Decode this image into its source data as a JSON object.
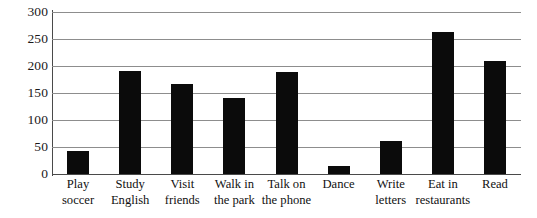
{
  "chart_data": {
    "type": "bar",
    "title": "",
    "subtitle": "",
    "xlabel": "",
    "ylabel": "",
    "categories": [
      "Play\nsoccer",
      "Study\nEnglish",
      "Visit\nfriends",
      "Walk in\nthe park",
      "Talk on\nthe phone",
      "Dance",
      "Write\nletters",
      "Eat in\nrestaurants",
      "Read"
    ],
    "values": [
      42,
      191,
      166,
      140,
      189,
      15,
      61,
      263,
      209
    ],
    "ylim": [
      0,
      300
    ],
    "ytick_values": [
      0,
      50,
      100,
      150,
      200,
      250,
      300
    ],
    "ytick_labels": [
      "0",
      "50",
      "100",
      "150",
      "200",
      "250",
      "300"
    ],
    "grid": true,
    "grid_axis": "y",
    "legend": false,
    "legend_position": "none",
    "bar_color": "#0b0b0b",
    "grid_color": "#8d8d8d",
    "axis_color": "#4a4a4a",
    "background_color": "#ffffff"
  }
}
